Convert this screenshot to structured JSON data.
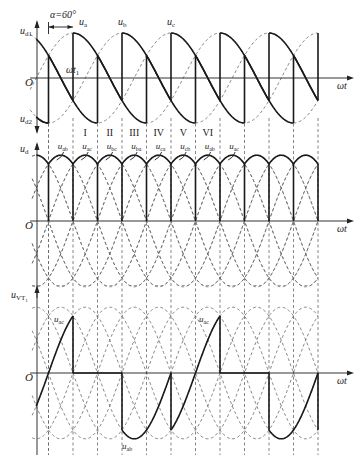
{
  "chart_data": {
    "type": "line",
    "alpha_label": "α=60°",
    "alpha_deg": 60,
    "x_axis_label": "ωt",
    "panels": [
      {
        "id": "phase",
        "ylabel_top": "u_d1",
        "ylabel_bottom": "u_d2",
        "origin_label": "O",
        "marker_label": "ωt₁",
        "series": [
          {
            "name": "u_a",
            "style": "dashed",
            "phase_deg": 0
          },
          {
            "name": "u_b",
            "style": "dashed",
            "phase_deg": -120
          },
          {
            "name": "u_c",
            "style": "dashed",
            "phase_deg": 120
          },
          {
            "name": "u_d1",
            "style": "solid",
            "desc": "positive-group output, fired 60° after natural commutation"
          },
          {
            "name": "u_d2",
            "style": "solid",
            "desc": "negative-group output"
          }
        ],
        "phase_labels": [
          "u_a",
          "u_b",
          "u_c"
        ]
      },
      {
        "id": "output",
        "ylabel": "u_d",
        "origin_label": "O",
        "intervals": [
          "I",
          "II",
          "III",
          "IV",
          "V",
          "VI"
        ],
        "line_voltage_labels": [
          "u_ab",
          "u_ac",
          "u_bc",
          "u_ba",
          "u_ca",
          "u_cb",
          "u_ab",
          "u_ac"
        ],
        "series": [
          {
            "name": "line voltages (uab, uac, ubc, uba, uca, ucb)",
            "style": "dashed"
          },
          {
            "name": "u_d",
            "style": "solid",
            "desc": "sawtooth segments, drops to zero at each commutation (α=60° boundary)"
          }
        ]
      },
      {
        "id": "thyristor",
        "ylabel": "u_VT1",
        "origin_label": "O",
        "annotations": [
          "u_ac",
          "u_ac",
          "u_ab"
        ],
        "series": [
          {
            "name": "line voltages",
            "style": "dashed"
          },
          {
            "name": "u_VT1",
            "style": "solid",
            "desc": "zero while VT1 conducts, follows u_ab then u_ac when blocked"
          }
        ]
      }
    ]
  },
  "labels": {
    "alpha": "α=60°",
    "ua": "u",
    "ua_sub": "a",
    "ub": "u",
    "ub_sub": "b",
    "uc": "u",
    "uc_sub": "c",
    "ud1": "u",
    "ud1_sub": "d1",
    "ud2": "u",
    "ud2_sub": "d2",
    "ud": "u",
    "ud_sub": "d",
    "uvt": "u",
    "uvt_sub": "VT",
    "uvt_subsub": "1",
    "origin": "O",
    "wt": "ωt",
    "wt1": "ωt",
    "wt1_sub": "1",
    "roman": [
      "I",
      "II",
      "III",
      "IV",
      "V",
      "VI"
    ],
    "line": [
      {
        "u": "u",
        "s": "ab"
      },
      {
        "u": "u",
        "s": "ac"
      },
      {
        "u": "u",
        "s": "bc"
      },
      {
        "u": "u",
        "s": "ba"
      },
      {
        "u": "u",
        "s": "ca"
      },
      {
        "u": "u",
        "s": "cb"
      },
      {
        "u": "u",
        "s": "ab"
      },
      {
        "u": "u",
        "s": "ac"
      }
    ],
    "vt_ac1": {
      "u": "u",
      "s": "ac"
    },
    "vt_ac2": {
      "u": "u",
      "s": "ac"
    },
    "vt_ab": {
      "u": "u",
      "s": "ab"
    }
  }
}
